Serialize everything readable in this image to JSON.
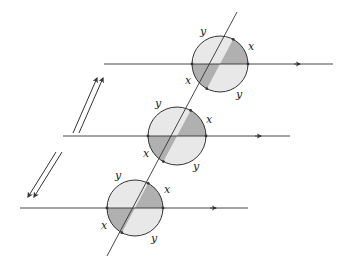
{
  "diagram": {
    "colors": {
      "line": "#333333",
      "light_fill": "#e8e8e8",
      "dark_fill": "#b0b0b0",
      "label": "#222222",
      "background": "#ffffff"
    },
    "diagonal_line": {
      "x1": 237,
      "y1": 12,
      "x2": 107,
      "y2": 256
    },
    "circles": [
      {
        "id": "top",
        "cx": 220,
        "cy": 64,
        "r": 28,
        "horizontal_line": {
          "x1": 104,
          "x2": 333,
          "y": 64,
          "arrow_x": 300
        },
        "labels": [
          {
            "text": "y",
            "x": 200,
            "y": 35
          },
          {
            "text": "x",
            "x": 248,
            "y": 50
          },
          {
            "text": "x",
            "x": 185,
            "y": 84
          },
          {
            "text": "y",
            "x": 236,
            "y": 98
          }
        ]
      },
      {
        "id": "middle",
        "cx": 177,
        "cy": 136,
        "r": 29,
        "horizontal_line": {
          "x1": 63,
          "x2": 290,
          "y": 136,
          "arrow_x": 261
        },
        "labels": [
          {
            "text": "y",
            "x": 155,
            "y": 107
          },
          {
            "text": "x",
            "x": 206,
            "y": 123
          },
          {
            "text": "x",
            "x": 143,
            "y": 157
          },
          {
            "text": "y",
            "x": 193,
            "y": 170
          }
        ]
      },
      {
        "id": "bottom",
        "cx": 135,
        "cy": 208,
        "r": 28,
        "horizontal_line": {
          "x1": 20,
          "x2": 248,
          "y": 208,
          "arrow_x": 216
        },
        "labels": [
          {
            "text": "y",
            "x": 115,
            "y": 179
          },
          {
            "text": "x",
            "x": 164,
            "y": 193
          },
          {
            "text": "x",
            "x": 101,
            "y": 229
          },
          {
            "text": "y",
            "x": 151,
            "y": 242
          }
        ]
      }
    ],
    "arrow_pairs": [
      {
        "direction": "up-right",
        "arrows": [
          {
            "x1": 73,
            "y1": 133,
            "x2": 97,
            "y2": 78
          },
          {
            "x1": 79,
            "y1": 133,
            "x2": 103,
            "y2": 78
          }
        ]
      },
      {
        "direction": "down-left",
        "arrows": [
          {
            "x1": 56,
            "y1": 152,
            "x2": 28,
            "y2": 197
          },
          {
            "x1": 62,
            "y1": 152,
            "x2": 34,
            "y2": 197
          }
        ]
      }
    ]
  }
}
